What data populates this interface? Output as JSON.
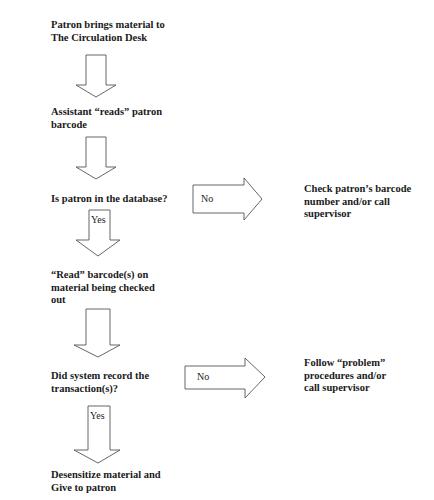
{
  "flowchart": {
    "nodes": [
      {
        "id": "start",
        "text": "Patron brings material to\nThe Circulation Desk"
      },
      {
        "id": "read_patron",
        "text": "Assistant “reads” patron\nbarcode"
      },
      {
        "id": "decision_patron",
        "text": "Is patron in the database?"
      },
      {
        "id": "check_barcode",
        "text": "Check patron’s barcode\nnumber and/or call\nsupervisor"
      },
      {
        "id": "read_material",
        "text": "“Read” barcode(s) on\nmaterial being checked\nout"
      },
      {
        "id": "decision_record",
        "text": "Did system record the\ntransaction(s)?"
      },
      {
        "id": "problem",
        "text": "Follow “problem”\nprocedures and/or\ncall supervisor"
      },
      {
        "id": "end",
        "text": "Desensitize material and\nGive to patron"
      }
    ],
    "edge_labels": {
      "no1": "No",
      "yes1": "Yes",
      "no2": "No",
      "yes2": "Yes"
    },
    "colors": {
      "arrow_stroke": "#555555",
      "text": "#1a1a1a",
      "background": "#ffffff"
    }
  }
}
